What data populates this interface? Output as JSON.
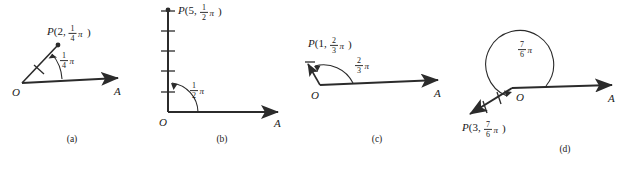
{
  "figure": {
    "background_color": "#ffffff",
    "ink_color": "#2b2b2b"
  },
  "panels": [
    {
      "id": "a",
      "caption": "(a)",
      "point_label": {
        "name": "P",
        "radius": "2",
        "angle_numerator": "1",
        "angle_denominator": "4",
        "angle_symbol": "π",
        "full": "P(2, 1/4 π)"
      },
      "angle_label": {
        "numerator": "1",
        "denominator": "4",
        "symbol": "π",
        "full": "1/4 π"
      },
      "origin_label": "O",
      "axis_label": "A",
      "radius_ticks": 1,
      "angle_degrees": 45,
      "radius_units": 2
    },
    {
      "id": "b",
      "caption": "(b)",
      "point_label": {
        "name": "P",
        "radius": "5",
        "angle_numerator": "1",
        "angle_denominator": "2",
        "angle_symbol": "π",
        "full": "P(5, 1/2 π)"
      },
      "angle_label": {
        "numerator": "1",
        "denominator": "2",
        "symbol": "π",
        "full": "1/2 π"
      },
      "origin_label": "O",
      "axis_label": "A",
      "radius_ticks": 5,
      "angle_degrees": 90,
      "radius_units": 5
    },
    {
      "id": "c",
      "caption": "(c)",
      "point_label": {
        "name": "P",
        "radius": "1",
        "angle_numerator": "2",
        "angle_denominator": "3",
        "angle_symbol": "π",
        "full": "P(1, 2/3 π)"
      },
      "angle_label": {
        "numerator": "2",
        "denominator": "3",
        "symbol": "π",
        "full": "2/3 π"
      },
      "origin_label": "O",
      "axis_label": "A",
      "radius_ticks": 0,
      "angle_degrees": 120,
      "radius_units": 1
    },
    {
      "id": "d",
      "caption": "(d)",
      "point_label": {
        "name": "P",
        "radius": "3",
        "angle_numerator": "7",
        "angle_denominator": "6",
        "angle_symbol": "π",
        "full": "P(3, 7/6 π)"
      },
      "angle_label": {
        "numerator": "7",
        "denominator": "6",
        "symbol": "π",
        "full": "7/6 π"
      },
      "origin_label": "O",
      "axis_label": "A",
      "radius_ticks": 2,
      "angle_degrees": 210,
      "radius_units": 3
    }
  ]
}
